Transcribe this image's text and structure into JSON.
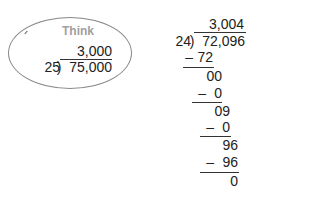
{
  "think_bubble": {
    "label": "Think",
    "quotient": "3,000",
    "divisor": "25",
    "dividend": "75,000"
  },
  "long_division": {
    "quotient": "3,004",
    "divisor": "24",
    "dividend": "72,096",
    "steps": [
      {
        "subtract": "72",
        "result": "00"
      },
      {
        "subtract": "0",
        "result": "09"
      },
      {
        "subtract": "0",
        "result": "96"
      },
      {
        "subtract": "96",
        "result": "0"
      }
    ],
    "minus_sign": "–"
  }
}
